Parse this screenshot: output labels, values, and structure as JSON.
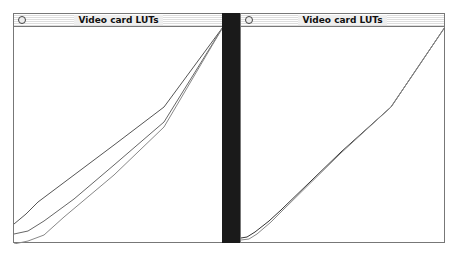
{
  "windows": [
    {
      "title": "Video card LUTs",
      "curves": [
        {
          "name": "curve-1",
          "color": "#555555",
          "points": "0,197 12,187 24,175 60,148 100,118 150,80 209,0"
        },
        {
          "name": "curve-2",
          "color": "#666666",
          "points": "0,207 14,204 30,194 60,172 100,138 150,95 209,0"
        },
        {
          "name": "curve-3",
          "color": "#888888",
          "points": "0,217 14,214 30,208 50,190 100,148 150,100 209,0"
        }
      ]
    },
    {
      "title": "Video card LUTs",
      "curves": [
        {
          "name": "curve-1",
          "color": "#333333",
          "points": "0,211 6,210 14,205 28,194 40,183 100,125 150,80 204,0"
        },
        {
          "name": "curve-2",
          "color": "#888888",
          "points": "0,213 8,212 16,207 30,195 42,183 100,126 150,80 204,0"
        }
      ]
    }
  ]
}
